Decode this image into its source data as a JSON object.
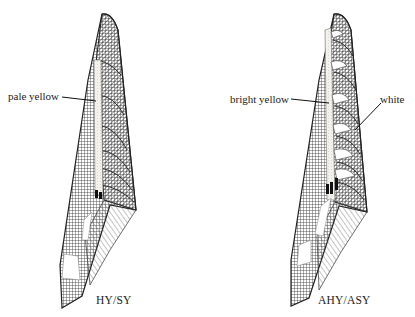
{
  "figure": {
    "panels": [
      {
        "id": "left",
        "caption": "HY/SY",
        "callouts": [
          {
            "label": "pale yellow",
            "target": "wing-covert-edge-patch"
          }
        ]
      },
      {
        "id": "right",
        "caption": "AHY/ASY",
        "callouts": [
          {
            "label": "bright yellow",
            "target": "wing-covert-edge-patch"
          },
          {
            "label": "white",
            "target": "covert-tip"
          }
        ]
      }
    ],
    "colors": {
      "ink": "#222222",
      "background": "#ffffff",
      "pale_patch": "#f4f2ec"
    }
  }
}
